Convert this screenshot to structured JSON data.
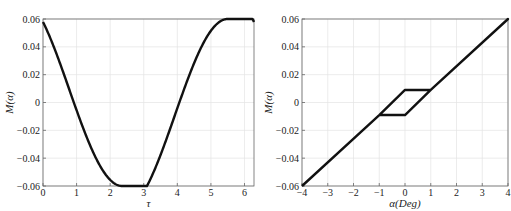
{
  "chart_data": [
    {
      "type": "line",
      "title": "",
      "xlabel": "τ",
      "ylabel": "M(α)",
      "xlim": [
        0,
        6.2832
      ],
      "ylim": [
        -0.06,
        0.06
      ],
      "xticks": [
        "0",
        "1",
        "2",
        "3",
        "4",
        "5",
        "6"
      ],
      "yticks": [
        "−0.06",
        "−0.04",
        "−0.02",
        "0",
        "0.02",
        "0.04",
        "0.06"
      ],
      "grid": true,
      "series": [
        {
          "name": "M(α) vs τ",
          "x": [
            0,
            0.35,
            0.72,
            1.1,
            1.5,
            2.0,
            2.35,
            2.8,
            3.3,
            3.9,
            4.25,
            4.7,
            5.1,
            5.5,
            5.9,
            6.28
          ],
          "y": [
            0.035,
            0.013,
            -0.009,
            -0.009,
            -0.032,
            -0.054,
            -0.06,
            -0.05,
            -0.026,
            0.009,
            0.009,
            0.036,
            0.053,
            0.06,
            0.053,
            0.035
          ]
        }
      ]
    },
    {
      "type": "line",
      "title": "",
      "xlabel": "α(Deg)",
      "ylabel": "M(α)",
      "xlim": [
        -4,
        4
      ],
      "ylim": [
        -0.06,
        0.06
      ],
      "xticks": [
        "−4",
        "−3",
        "−2",
        "−1",
        "0",
        "1",
        "2",
        "3",
        "4"
      ],
      "yticks": [
        "−0.06",
        "−0.04",
        "−0.02",
        "0",
        "0.02",
        "0.04",
        "0.06"
      ],
      "grid": true,
      "series": [
        {
          "name": "M(α) hysteresis",
          "x": [
            -4,
            -1,
            0,
            1,
            4,
            1,
            0,
            -1,
            -4
          ],
          "y": [
            -0.06,
            -0.009,
            0.009,
            0.009,
            0.06,
            0.009,
            -0.009,
            -0.009,
            -0.06
          ]
        }
      ]
    }
  ],
  "left": {
    "xlabel": "τ",
    "ylabel": "M(α)"
  },
  "right": {
    "xlabel": "α(Deg)",
    "ylabel": "M(α)"
  }
}
